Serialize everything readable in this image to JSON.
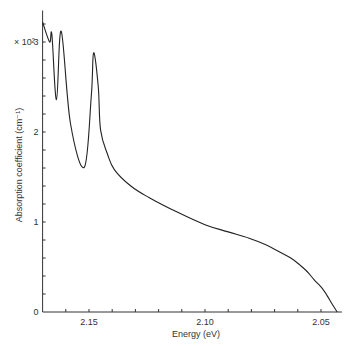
{
  "chart_data": {
    "type": "line",
    "title": "",
    "xlabel": "Energy (eV)",
    "ylabel": "Absorption coefficient (cm⁻¹)",
    "y_multiplier_label": "× 10²",
    "x_reversed": true,
    "xlim": [
      2.17,
      2.041
    ],
    "ylim": [
      0,
      3.35
    ],
    "x_ticks": [
      2.15,
      2.1,
      2.05
    ],
    "x_tick_labels": [
      "2.15",
      "2.10",
      "2.05"
    ],
    "x_minor_step": 0.01,
    "y_ticks": [
      0,
      1,
      2,
      3
    ],
    "y_tick_labels": [
      "0",
      "1",
      "2",
      "3"
    ],
    "y_minor_step": 0.2,
    "grid": false,
    "legend": null,
    "series": [
      {
        "name": "Absorption coefficient",
        "color": "#222222",
        "x": [
          2.17,
          2.167,
          2.166,
          2.164,
          2.162,
          2.158,
          2.152,
          2.149,
          2.148,
          2.146,
          2.145,
          2.142,
          2.139,
          2.132,
          2.124,
          2.112,
          2.1,
          2.09,
          2.081,
          2.074,
          2.068,
          2.063,
          2.059,
          2.056,
          2.053,
          2.05,
          2.048,
          2.045,
          2.043
        ],
        "y": [
          3.22,
          3.0,
          3.08,
          2.36,
          3.12,
          2.1,
          1.61,
          2.4,
          2.88,
          2.5,
          2.02,
          1.75,
          1.58,
          1.4,
          1.27,
          1.11,
          0.97,
          0.89,
          0.82,
          0.75,
          0.67,
          0.6,
          0.52,
          0.45,
          0.36,
          0.28,
          0.21,
          0.08,
          0.0
        ]
      }
    ]
  }
}
